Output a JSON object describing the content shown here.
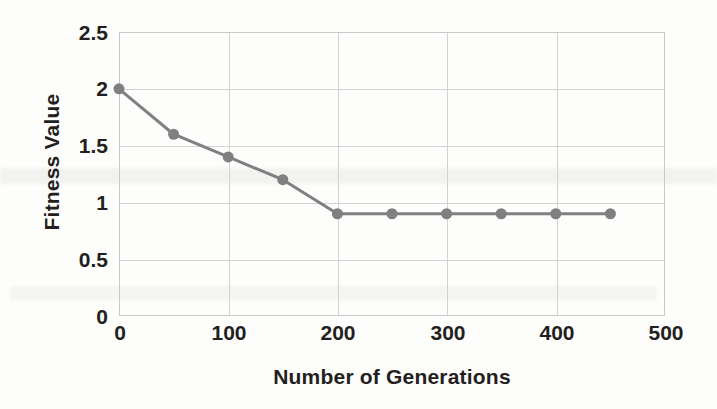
{
  "chart_data": {
    "type": "line",
    "title": "",
    "xlabel": "Number of Generations",
    "ylabel": "Fitness Value",
    "xlim": [
      0,
      500
    ],
    "ylim": [
      0,
      2.5
    ],
    "xticks": [
      "0",
      "100",
      "200",
      "300",
      "400",
      "500"
    ],
    "xtick_values": [
      0,
      100,
      200,
      300,
      400,
      500
    ],
    "yticks": [
      "0",
      "0.5",
      "1",
      "1.5",
      "2",
      "2.5"
    ],
    "ytick_values": [
      0,
      0.5,
      1,
      1.5,
      2,
      2.5
    ],
    "grid": true,
    "legend": null,
    "series": [
      {
        "name": "Fitness Value",
        "color": "#808080",
        "marker": "circle",
        "x": [
          0,
          50,
          100,
          150,
          200,
          250,
          300,
          350,
          400,
          450
        ],
        "values": [
          2.0,
          1.6,
          1.4,
          1.2,
          0.9,
          0.9,
          0.9,
          0.9,
          0.9,
          0.9
        ]
      }
    ]
  },
  "style": {
    "line_color": "#808080",
    "marker_color": "#808080",
    "grid_color": "#d2d2d2",
    "frame_color": "#c9c9c9",
    "text_color": "#231f20",
    "background": "#fdfdfc"
  }
}
